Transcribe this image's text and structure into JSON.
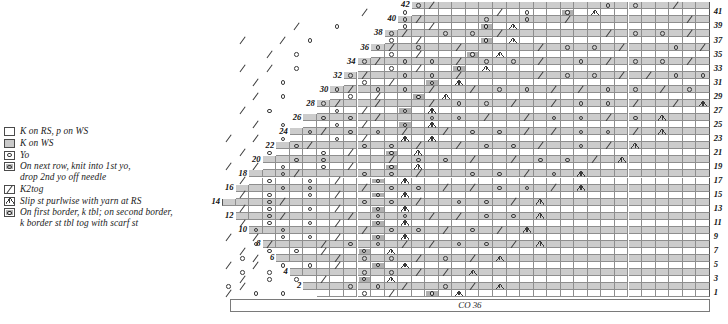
{
  "legend": {
    "title": "Chart Key",
    "items": [
      {
        "symbol": "knit-rs-purl-ws",
        "label": "K on RS, p on WS"
      },
      {
        "symbol": "knit-ws",
        "label": "K on WS"
      },
      {
        "symbol": "yo",
        "label": "Yo"
      },
      {
        "symbol": "double-yo",
        "label": "On next row, knit into 1st yo,\ndrop 2nd yo off needle"
      },
      {
        "symbol": "k2tog",
        "label": "K2tog"
      },
      {
        "symbol": "slip-purlwise",
        "label": "Slip st purlwise with yarn at RS"
      },
      {
        "symbol": "k-tbl-border",
        "label": "On first border, k tbl; on second border,\nk border st tbl tog with scarf st"
      }
    ]
  },
  "chart": {
    "cast_on_label": "CO 36",
    "left_row_numbers": [
      2,
      4,
      6,
      8,
      10,
      12,
      14,
      16,
      18,
      20,
      22,
      24,
      26,
      28,
      30,
      32,
      34,
      36,
      38,
      40,
      42
    ],
    "right_row_numbers": [
      1,
      3,
      5,
      7,
      9,
      11,
      13,
      15,
      17,
      19,
      21,
      23,
      25,
      27,
      29,
      31,
      33,
      35,
      37,
      39,
      41
    ],
    "total_rows": 42,
    "total_columns": 36,
    "colors": {
      "rs_row": "#ffffff",
      "ws_row": "#cccccc",
      "grid_line": "#8e8e8e",
      "symbol": "#3a3a3a",
      "border_cell": "#c4c4c4"
    }
  },
  "chart_data": {
    "type": "table",
    "title": "CO 36",
    "xlabel": "stitches",
    "ylabel": "rows",
    "symbol_codes": {
      "k": "K on RS, p on WS",
      "p": "K on WS",
      "o": "Yo",
      "O": "double yo",
      "/": "K2tog",
      "v": "Slip st purlwise with yarn at RS",
      "b": "k tbl border"
    },
    "rows": [
      {
        "n": 42,
        "start": 14,
        "cells": "o/            o o  /       o o / /  o o /"
      },
      {
        "n": 41,
        "start": 0,
        "cells": "          /  o      / o  b v"
      },
      {
        "n": 40,
        "start": 13,
        "cells": "o/    o  o  /        / o     o /   o o / v"
      },
      {
        "n": 39,
        "start": 0,
        "cells": "     /  o    o /   b v"
      },
      {
        "n": 38,
        "start": 12,
        "cells": "o/  o o /       / o o /  / o o / o / b v"
      },
      {
        "n": 37,
        "start": 0,
        "cells": " /  / o     o /    b v"
      },
      {
        "n": 36,
        "start": 11,
        "cells": "o/ o  /     / o o /   o / o o /  o / v"
      },
      {
        "n": 35,
        "start": 0,
        "cells": "   / o      o /   b v"
      },
      {
        "n": 34,
        "start": 10,
        "cells": "o/ o o / o o /  o / o o / / o o  / v"
      },
      {
        "n": 33,
        "start": 0,
        "cells": " / / o      o /  b v"
      },
      {
        "n": 32,
        "start": 9,
        "cells": "o/  o o /     / o o / / o o /  o v"
      },
      {
        "n": 31,
        "start": 0,
        "cells": "  / o     o /  b v"
      },
      {
        "n": 30,
        "start": 8,
        "cells": "o/ o o /  / o o / / o o / o / v"
      },
      {
        "n": 29,
        "start": 0,
        "cells": "  / o    o /  b v"
      },
      {
        "n": 28,
        "start": 7,
        "cells": "o/  /   / o o /  / o o /  / v"
      },
      {
        "n": 27,
        "start": 0,
        "cells": " / o    o /  b v"
      },
      {
        "n": 26,
        "start": 7,
        "cells": "o o /   o o /  / o o / o v"
      },
      {
        "n": 25,
        "start": 0,
        "cells": "  / o   o /  b v"
      },
      {
        "n": 24,
        "start": 6,
        "cells": "o/ o o /  / o o / / o o / v"
      },
      {
        "n": 23,
        "start": 0,
        "cells": "/ / o   o /  v v"
      },
      {
        "n": 22,
        "start": 5,
        "cells": "o/   o o /  / o o /  o / v"
      },
      {
        "n": 21,
        "start": 0,
        "cells": " / o   o /  b v"
      },
      {
        "n": 20,
        "start": 5,
        "cells": "o o    / o o /  / o o / v"
      },
      {
        "n": 19,
        "start": 0,
        "cells": "/ / o  o /  b v"
      },
      {
        "n": 18,
        "start": 4,
        "cells": "o/    o o /   o o / o v"
      },
      {
        "n": 17,
        "start": 0,
        "cells": " / o  o /  b v"
      },
      {
        "n": 16,
        "start": 4,
        "cells": "o o   / o o / / o o / v"
      },
      {
        "n": 15,
        "start": 0,
        "cells": " / o  o /  b v"
      },
      {
        "n": 14,
        "start": 3,
        "cells": "o/     o o /  o o / v"
      },
      {
        "n": 13,
        "start": 0,
        "cells": " / o  o /  b v"
      },
      {
        "n": 12,
        "start": 3,
        "cells": "o/    / o o / / o o v"
      },
      {
        "n": 11,
        "start": 0,
        "cells": " / o  o /  b v"
      },
      {
        "n": 10,
        "start": 2,
        "cells": "o o     / o o / o / v"
      },
      {
        "n": 9,
        "start": 0,
        "cells": "/ / o o /  b v"
      },
      {
        "n": 8,
        "start": 2,
        "cells": "o/   / o o / / o o / v"
      },
      {
        "n": 7,
        "start": 0,
        "cells": " / o o /  b v"
      },
      {
        "n": 6,
        "start": 1,
        "cells": "o/     / o o / o / v"
      },
      {
        "n": 5,
        "start": 0,
        "cells": "/ / o o /  b v"
      },
      {
        "n": 4,
        "start": 1,
        "cells": "o o      o o / / v"
      },
      {
        "n": 3,
        "start": 0,
        "cells": " / o o /  b v"
      },
      {
        "n": 2,
        "start": 0,
        "cells": "o/       o o /  o / v"
      },
      {
        "n": 1,
        "start": 0,
        "cells": "/ o o     o /  b v"
      }
    ]
  }
}
